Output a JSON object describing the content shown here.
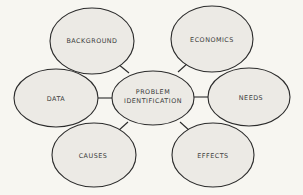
{
  "diagram": {
    "colors": {
      "background": "#f7f6f1",
      "node_fill": "#eceae5",
      "stroke": "#2b2b2b",
      "text": "#3a3a3a"
    },
    "center": {
      "line1": "PROBLEM",
      "line2": "IDENTIFICATION"
    },
    "nodes": [
      {
        "label": "BACKGROUND"
      },
      {
        "label": "ECONOMICS"
      },
      {
        "label": "DATA"
      },
      {
        "label": "NEEDS"
      },
      {
        "label": "CAUSES"
      },
      {
        "label": "EFFECTS"
      }
    ]
  }
}
